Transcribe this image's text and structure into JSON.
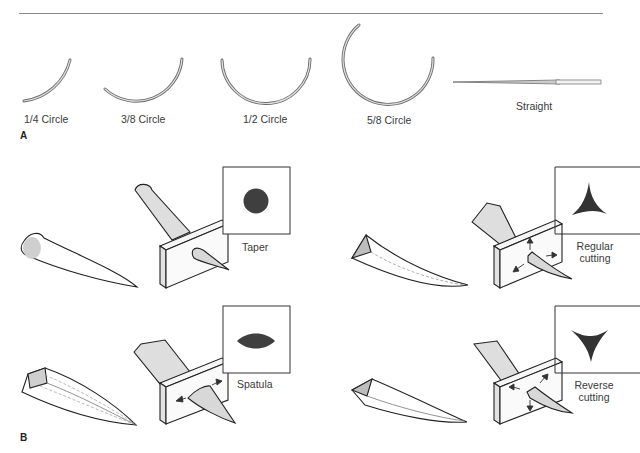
{
  "figure": {
    "panel_a": {
      "letter": "A",
      "needle_shapes": [
        {
          "label": "1/4 Circle"
        },
        {
          "label": "3/8 Circle"
        },
        {
          "label": "1/2 Circle"
        },
        {
          "label": "5/8 Circle"
        },
        {
          "label": "Straight"
        }
      ]
    },
    "panel_b": {
      "letter": "B",
      "point_types": [
        {
          "label": "Taper",
          "cross_section": "circle"
        },
        {
          "label_line1": "Regular",
          "label_line2": "cutting",
          "cross_section": "three-point-star-up"
        },
        {
          "label": "Spatula",
          "cross_section": "lens"
        },
        {
          "label_line1": "Reverse",
          "label_line2": "cutting",
          "cross_section": "three-point-star-down"
        }
      ]
    },
    "colors": {
      "line": "#2a2a2a",
      "fill_light": "#e6e6e6",
      "fill_shade": "#c4c4c4",
      "cross_section": "#3f3f3f",
      "rule": "#8a8a8a"
    }
  }
}
